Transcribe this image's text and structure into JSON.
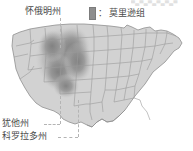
{
  "figure": {
    "width": 193,
    "height": 151,
    "background": "#ffffff",
    "top_cropped_text": "▀▄▀▄▀▄▀▄▀▄▀"
  },
  "legend": {
    "swatch_name": "formation-swatch",
    "swatch_color": "#8e8e8e",
    "separator": "：",
    "label": "莫里逊组"
  },
  "labels": {
    "wyoming": "怀俄明州",
    "utah": "犹他州",
    "colorado": "科罗拉多州"
  },
  "map": {
    "name": "united-states-map",
    "land_fill": "#d2d2d2",
    "land_stroke": "#9a9a9a",
    "formation_fill": "#8c8c8c",
    "formation_fill_mid": "#a5a5a5",
    "formation_fill_outer": "#bdbdbd"
  }
}
